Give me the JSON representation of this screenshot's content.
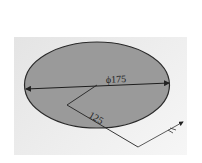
{
  "diagram": {
    "shape": "ellipse",
    "colors": {
      "background": "#ffffff",
      "panel": "#ebebeb",
      "ellipse_fill": "#9a9a9a",
      "outline": "#2a2a2a"
    },
    "dimensions": {
      "diameter_label": "ϕ175",
      "radius_label": "125"
    },
    "icons": {
      "triad": "coordinate-axes-icon"
    }
  }
}
